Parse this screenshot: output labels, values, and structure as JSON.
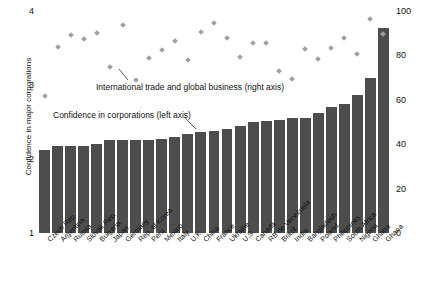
{
  "chart_data": {
    "type": "bar",
    "title": "",
    "categories": [
      "Czech Rep.",
      "Argentina",
      "Russia",
      "Slovak Rep.",
      "Bulgaria",
      "Japan",
      "Germany",
      "Rep. of Korea",
      "Peru",
      "Mexico",
      "Italy",
      "U.K.",
      "China",
      "France",
      "Ukraine",
      "U.S.",
      "Canada",
      "RB de Venezuela",
      "Brazil",
      "India",
      "Bangladesh",
      "Poland",
      "Philippines",
      "South Africa",
      "Nigeria",
      "Ghana",
      "Ghana"
    ],
    "series": [
      {
        "name": "Confidence in corporations (left axis)",
        "axis": "left",
        "type": "bar",
        "values": [
          2.12,
          2.18,
          2.18,
          2.18,
          2.2,
          2.26,
          2.26,
          2.26,
          2.26,
          2.27,
          2.3,
          2.34,
          2.36,
          2.38,
          2.4,
          2.44,
          2.5,
          2.52,
          2.53,
          2.56,
          2.56,
          2.62,
          2.7,
          2.74,
          2.86,
          3.1,
          3.77
        ]
      },
      {
        "name": "International trade and global business (right axis)",
        "axis": "right",
        "type": "scatter",
        "values": [
          61.5,
          84.0,
          89.0,
          87.5,
          90.0,
          75.0,
          93.5,
          69.0,
          79.0,
          82.5,
          86.5,
          78.0,
          90.5,
          94.5,
          88.0,
          79.5,
          85.5,
          85.5,
          73.0,
          69.5,
          83.0,
          78.5,
          83.5,
          88.0,
          80.5,
          96.5,
          89.5
        ]
      }
    ],
    "left_axis": {
      "label": "Confidence in major corporations",
      "ticks": [
        "4",
        "3",
        "2",
        "1"
      ],
      "min": 1,
      "max": 4
    },
    "right_axis": {
      "label": "Support for international trade and business",
      "ticks": [
        "100",
        "80",
        "60",
        "40",
        "20",
        "0"
      ],
      "min": 0,
      "max": 100
    },
    "annotations": [
      {
        "id": "trade",
        "text": "International trade and global business (right axis)"
      },
      {
        "id": "confidence",
        "text": "Confidence in corporations (left axis)"
      }
    ],
    "colors": {
      "bar": "#4d4d4d",
      "marker": "#a0a0a0",
      "text": "#111111",
      "background": "#ffffff"
    },
    "grid": false,
    "legend": "inline-annotations"
  }
}
